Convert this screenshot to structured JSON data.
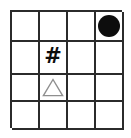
{
  "figure": {
    "name": "four-by-four-symbol-grid",
    "rows": 4,
    "columns": 4,
    "background_color": "#ffffff",
    "grid_line_color": "#2b2b2b",
    "grid_line_width_px": 2
  },
  "symbols": {
    "circle": {
      "icon": "filled-circle-icon",
      "label": "●",
      "color": "#0d0d0d",
      "style": "filled"
    },
    "hash": {
      "icon": "hash-icon",
      "label": "#",
      "color": "#0d0d0d",
      "style": "bold-glyph"
    },
    "triangle": {
      "icon": "outline-triangle-icon",
      "label": "△",
      "color": "#8f8f8f",
      "style": "outline"
    },
    "empty": {
      "icon": "empty-cell-icon",
      "label": "",
      "color": "#ffffff",
      "style": "none"
    }
  },
  "cells": [
    [
      {
        "row": 1,
        "col": 1,
        "content": "empty"
      },
      {
        "row": 1,
        "col": 2,
        "content": "empty"
      },
      {
        "row": 1,
        "col": 3,
        "content": "empty"
      },
      {
        "row": 1,
        "col": 4,
        "content": "circle"
      }
    ],
    [
      {
        "row": 2,
        "col": 1,
        "content": "empty"
      },
      {
        "row": 2,
        "col": 2,
        "content": "hash"
      },
      {
        "row": 2,
        "col": 3,
        "content": "empty"
      },
      {
        "row": 2,
        "col": 4,
        "content": "empty"
      }
    ],
    [
      {
        "row": 3,
        "col": 1,
        "content": "empty"
      },
      {
        "row": 3,
        "col": 2,
        "content": "triangle"
      },
      {
        "row": 3,
        "col": 3,
        "content": "empty"
      },
      {
        "row": 3,
        "col": 4,
        "content": "empty"
      }
    ],
    [
      {
        "row": 4,
        "col": 1,
        "content": "empty"
      },
      {
        "row": 4,
        "col": 2,
        "content": "empty"
      },
      {
        "row": 4,
        "col": 3,
        "content": "empty"
      },
      {
        "row": 4,
        "col": 4,
        "content": "empty"
      }
    ]
  ]
}
